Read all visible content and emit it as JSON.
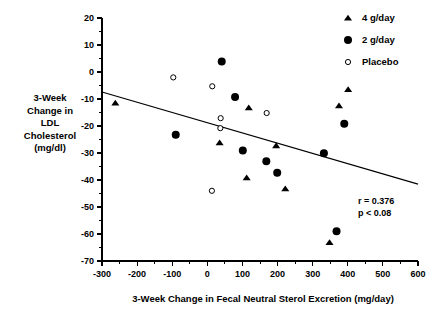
{
  "chart_data": {
    "type": "scatter",
    "title": "",
    "xlabel": "3-Week Change in Fecal Neutral Sterol Excretion (mg/day)",
    "ylabel": "3-Week Change in LDL Cholesterol (mg/dl)",
    "ylabel_lines": [
      "3-Week",
      "Change in",
      "LDL",
      "Cholesterol",
      "(mg/dl)"
    ],
    "xlim": [
      -300,
      600
    ],
    "ylim": [
      -70,
      20
    ],
    "xticks": [
      -300,
      -200,
      -100,
      0,
      100,
      200,
      300,
      400,
      500,
      600
    ],
    "yticks": [
      20,
      10,
      0,
      -10,
      -20,
      -30,
      -40,
      -50,
      -60,
      -70
    ],
    "xtick_labels": [
      "-300",
      "-200",
      "-100",
      "0",
      "100",
      "200",
      "300",
      "400",
      "500",
      "600"
    ],
    "ytick_labels": [
      "20",
      "10",
      "0",
      "-10",
      "-20",
      "-30",
      "-40",
      "-50",
      "-60",
      "-70"
    ],
    "minor_ticks": true,
    "grid": false,
    "legend_position": "top-right",
    "series": [
      {
        "name": "4 g/day",
        "marker": "filled-triangle",
        "color": "#000000",
        "points": [
          {
            "x": -262,
            "y": -11.5
          },
          {
            "x": 35,
            "y": -26.2
          },
          {
            "x": 118,
            "y": -13.3
          },
          {
            "x": 112,
            "y": -39.2
          },
          {
            "x": 196,
            "y": -27.3
          },
          {
            "x": 222,
            "y": -43.3
          },
          {
            "x": 348,
            "y": -63.2
          },
          {
            "x": 375,
            "y": -12.5
          },
          {
            "x": 401,
            "y": -6.5
          }
        ]
      },
      {
        "name": "2 g/day",
        "marker": "filled-circle",
        "color": "#000000",
        "points": [
          {
            "x": -90,
            "y": -23.2
          },
          {
            "x": 41,
            "y": 3.9
          },
          {
            "x": 79,
            "y": -9.3
          },
          {
            "x": 101,
            "y": -29.1
          },
          {
            "x": 168,
            "y": -33.1
          },
          {
            "x": 199,
            "y": -37.3
          },
          {
            "x": 332,
            "y": -30.1
          },
          {
            "x": 368,
            "y": -59.0
          },
          {
            "x": 390,
            "y": -19.2
          }
        ]
      },
      {
        "name": "Placebo",
        "marker": "open-circle",
        "color": "#000000",
        "points": [
          {
            "x": -97,
            "y": -2.0
          },
          {
            "x": 14,
            "y": -5.3
          },
          {
            "x": 38,
            "y": -17.1
          },
          {
            "x": 37,
            "y": -20.8
          },
          {
            "x": 169,
            "y": -15.2
          },
          {
            "x": 13,
            "y": -44.0
          }
        ]
      }
    ],
    "trend_line": {
      "x_start": -300,
      "y_start": -7.4,
      "x_end": 600,
      "y_end": -41.5
    },
    "annotations": [
      {
        "text": "r = 0.376"
      },
      {
        "text": "p < 0.08"
      }
    ]
  },
  "legend": {
    "items": [
      {
        "label": "4 g/day",
        "marker": "filled-triangle"
      },
      {
        "label": "2 g/day",
        "marker": "filled-circle"
      },
      {
        "label": "Placebo",
        "marker": "open-circle"
      }
    ]
  },
  "stats": {
    "r_value": "r = 0.376",
    "p_value": "p < 0.08"
  }
}
